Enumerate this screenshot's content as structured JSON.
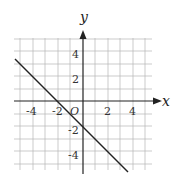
{
  "diagram": {
    "type": "coordinate-plane-line",
    "axes": {
      "x_label": "x",
      "y_label": "y",
      "origin_label": "O"
    },
    "x_ticks": [
      "-4",
      "-2",
      "2",
      "4"
    ],
    "y_ticks": [
      "4",
      "2",
      "-2",
      "-4"
    ],
    "grid": {
      "range": [
        -5,
        5
      ],
      "step": 1
    },
    "line": {
      "equation": "y = -x - 2",
      "x_intercept": -2,
      "y_intercept": -2,
      "color": "#222222"
    }
  }
}
